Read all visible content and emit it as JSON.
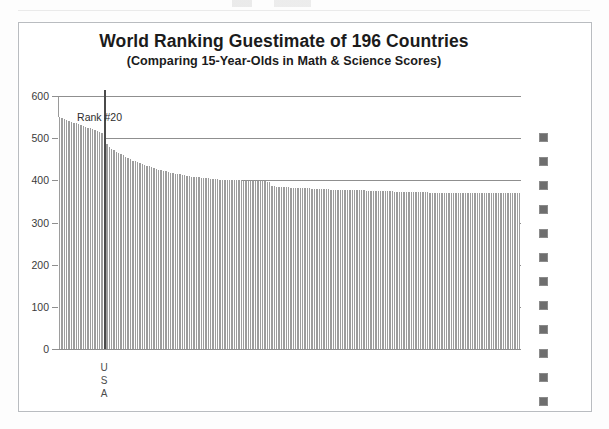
{
  "chart_data": {
    "type": "bar",
    "title": "World Ranking  Guestimate of 196 Countries",
    "subtitle": "(Comparing 15-Year-Olds in Math & Science Scores)",
    "xlabel": "",
    "ylabel": "",
    "ylim": [
      0,
      600
    ],
    "y_ticks": [
      0,
      100,
      200,
      300,
      400,
      500,
      600
    ],
    "grid": true,
    "n_categories": 196,
    "categories_note": "196 countries, unlabeled, sorted descending by score",
    "annotations": [
      {
        "name": "rank-20-label",
        "text": "Rank #20",
        "at_rank": 20,
        "value": 508
      },
      {
        "name": "usa-marker",
        "text": "U S A",
        "letters": [
          "U",
          "S",
          "A"
        ],
        "at_rank": 20
      }
    ],
    "legend": {
      "position": "right",
      "marker_color": "#6e6e6e",
      "marker_count": 12,
      "labels": []
    },
    "bar_color": "#9d9d9d",
    "values": [
      551,
      549,
      546,
      543,
      541,
      539,
      537,
      535,
      533,
      531,
      529,
      527,
      525,
      523,
      521,
      519,
      517,
      515,
      512,
      508,
      487,
      480,
      475,
      471,
      468,
      465,
      462,
      459,
      456,
      453,
      450,
      447,
      445,
      443,
      441,
      439,
      437,
      435,
      433,
      431,
      429,
      427,
      425,
      424,
      422,
      421,
      419,
      418,
      417,
      416,
      415,
      414,
      413,
      412,
      411,
      410,
      409,
      408,
      408,
      407,
      406,
      406,
      405,
      405,
      404,
      404,
      403,
      403,
      402,
      402,
      401,
      401,
      401,
      400,
      400,
      400,
      400,
      400,
      399,
      399,
      399,
      399,
      399,
      398,
      398,
      398,
      398,
      398,
      397,
      397,
      386,
      386,
      385,
      385,
      385,
      384,
      384,
      384,
      383,
      383,
      383,
      382,
      382,
      382,
      381,
      381,
      381,
      380,
      380,
      380,
      380,
      379,
      379,
      379,
      379,
      378,
      378,
      378,
      378,
      378,
      377,
      377,
      377,
      377,
      377,
      376,
      376,
      376,
      376,
      376,
      375,
      375,
      375,
      375,
      375,
      375,
      374,
      374,
      374,
      374,
      374,
      374,
      373,
      373,
      373,
      373,
      373,
      373,
      373,
      372,
      372,
      372,
      372,
      372,
      372,
      372,
      372,
      371,
      371,
      371,
      371,
      371,
      371,
      371,
      371,
      371,
      370,
      370,
      370,
      370,
      370,
      370,
      370,
      370,
      370,
      370,
      370,
      370,
      370,
      370,
      370,
      370,
      370,
      370,
      370,
      370,
      370,
      370,
      370,
      370,
      370,
      370,
      370,
      370,
      370,
      370
    ]
  }
}
